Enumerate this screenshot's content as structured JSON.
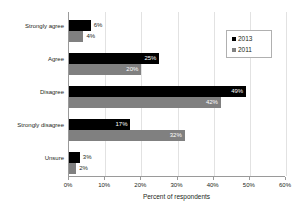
{
  "chart_data": {
    "type": "bar",
    "orientation": "horizontal",
    "title": "",
    "xlabel": "Percent of respondents",
    "ylabel": "",
    "xlim": [
      0,
      60
    ],
    "xticks": [
      0,
      10,
      20,
      30,
      40,
      50,
      60
    ],
    "xtick_labels": [
      "0%",
      "10%",
      "20%",
      "30%",
      "40%",
      "50%",
      "60%"
    ],
    "grid": "vertical",
    "legend_position": "top-right",
    "categories": [
      "Strongly agree",
      "Agree",
      "Disagree",
      "Strongly disagree",
      "Unsure"
    ],
    "series": [
      {
        "name": "2013",
        "color": "#000000",
        "values": [
          6,
          25,
          49,
          17,
          3
        ],
        "labels": [
          "6%",
          "25%",
          "49%",
          "17%",
          "3%"
        ]
      },
      {
        "name": "2011",
        "color": "#808080",
        "values": [
          4,
          20,
          42,
          32,
          2
        ],
        "labels": [
          "4%",
          "20%",
          "42%",
          "32%",
          "2%"
        ]
      }
    ]
  },
  "legend": {
    "entries": [
      {
        "label": "2013",
        "color": "#000000"
      },
      {
        "label": "2011",
        "color": "#808080"
      }
    ]
  },
  "axis": {
    "x_title": "Percent of respondents"
  }
}
